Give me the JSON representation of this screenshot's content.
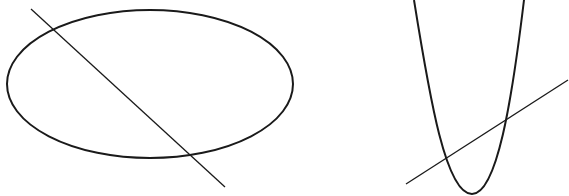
{
  "diagram": {
    "background": "#ffffff",
    "stroke_color": "#1a1a1a",
    "figures": [
      {
        "name": "ellipse-with-secant",
        "ellipse": {
          "cx": 150,
          "cy": 84,
          "rx": 143,
          "ry": 74
        },
        "line": {
          "x1": 31,
          "y1": 9,
          "x2": 225,
          "y2": 187
        }
      },
      {
        "name": "parabola-with-secant",
        "parabola": {
          "left_top": [
            414,
            0
          ],
          "vertex": [
            472,
            194
          ],
          "right_top": [
            524,
            0
          ]
        },
        "line": {
          "x1": 406,
          "y1": 184,
          "x2": 568,
          "y2": 80
        }
      }
    ]
  }
}
